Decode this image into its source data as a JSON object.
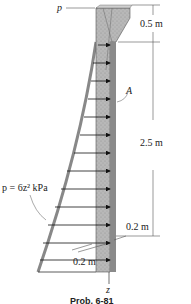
{
  "figure": {
    "labels": {
      "p_top": "p",
      "point_a": "A",
      "pressure_eq": "p = 6z² kPa",
      "z_axis": "z"
    },
    "dimensions": {
      "top_height": "0.5 m",
      "main_height": "2.5 m",
      "thickness_right": "0.2 m",
      "thickness_bottom": "0.2 m"
    },
    "caption": "Prob. 6-81"
  }
}
